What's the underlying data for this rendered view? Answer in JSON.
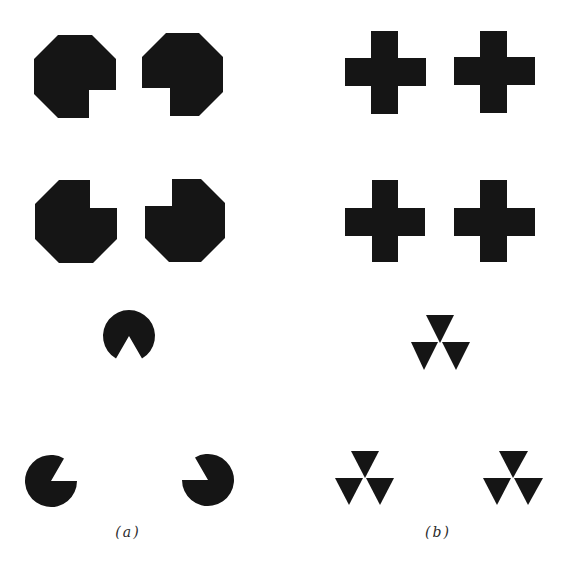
{
  "figure": {
    "ink_color": "#151515",
    "background": "#ffffff",
    "panels": [
      {
        "label": "(a)",
        "groups": [
          {
            "name": "notched-octagons",
            "count": 4,
            "notch_facing": "center",
            "illusory_shape": "square"
          },
          {
            "name": "pacman-disks",
            "count": 3,
            "mouth_facing": "center",
            "illusory_shape": "triangle"
          }
        ]
      },
      {
        "label": "(b)",
        "groups": [
          {
            "name": "crosses",
            "count": 4
          },
          {
            "name": "triangle-trefoils",
            "count": 3
          }
        ]
      }
    ]
  },
  "captions": {
    "a": "(a)",
    "b": "(b)"
  }
}
